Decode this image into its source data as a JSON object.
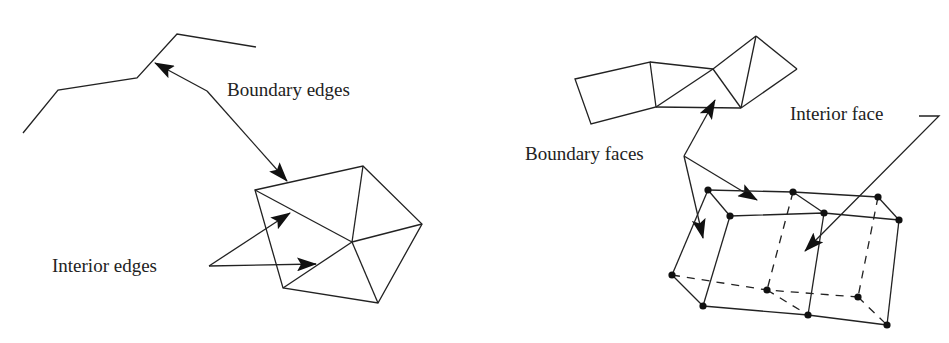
{
  "labels": {
    "boundary_edges": "Boundary edges",
    "interior_edges": "Interior edges",
    "boundary_faces": "Boundary faces",
    "interior_face": "Interior face"
  },
  "colors": {
    "ink": "#222222",
    "background": "#ffffff"
  },
  "left_figure": {
    "polyline_points": [
      [
        23,
        133
      ],
      [
        58,
        90
      ],
      [
        137,
        78
      ],
      [
        177,
        34
      ],
      [
        256,
        47
      ]
    ],
    "pentagon_vertices": [
      [
        255,
        190
      ],
      [
        363,
        166
      ],
      [
        422,
        224
      ],
      [
        378,
        303
      ],
      [
        283,
        288
      ]
    ],
    "pentagon_center": [
      352,
      242
    ]
  },
  "right_figure": {
    "surface_strip": "quad + triangles strip",
    "box_vertices_count": 12
  }
}
